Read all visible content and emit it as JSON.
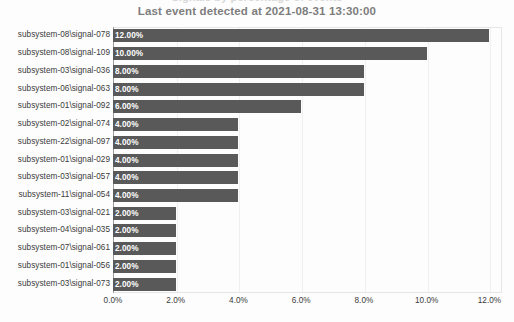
{
  "header": {
    "clipped_title": "Signals by percentage of events",
    "subtitle": "Last event detected at 2021-08-31 13:30:00"
  },
  "colors": {
    "bar": "#595959",
    "bar_label": "#ffffff",
    "subtitle": "#7d7d7d",
    "axis_text": "#3b3b3b",
    "grid": "#f0f0f0",
    "frame": "#e6e6e6",
    "background": "#fdfdfd"
  },
  "chart_data": {
    "type": "bar",
    "orientation": "horizontal",
    "title": "",
    "subtitle": "Last event detected at 2021-08-31 13:30:00",
    "xlabel": "",
    "ylabel": "",
    "xlim": [
      0,
      12.4
    ],
    "xticks": [
      0,
      2,
      4,
      6,
      8,
      10,
      12
    ],
    "xtick_labels": [
      "0.0%",
      "2.0%",
      "4.0%",
      "6.0%",
      "8.0%",
      "10.0%",
      "12.0%"
    ],
    "grid": true,
    "legend": false,
    "value_format": "percent",
    "categories": [
      "subsystem-08\\signal-078",
      "subsystem-08\\signal-109",
      "subsystem-03\\signal-036",
      "subsystem-06\\signal-063",
      "subsystem-01\\signal-092",
      "subsystem-02\\signal-074",
      "subsystem-22\\signal-097",
      "subsystem-01\\signal-029",
      "subsystem-03\\signal-057",
      "subsystem-11\\signal-054",
      "subsystem-03\\signal-021",
      "subsystem-04\\signal-035",
      "subsystem-07\\signal-061",
      "subsystem-01\\signal-056",
      "subsystem-03\\signal-073"
    ],
    "values": [
      12,
      10,
      8,
      8,
      6,
      4,
      4,
      4,
      4,
      4,
      2,
      2,
      2,
      2,
      2
    ],
    "data_labels": [
      "12.00%",
      "10.00%",
      "8.00%",
      "8.00%",
      "6.00%",
      "4.00%",
      "4.00%",
      "4.00%",
      "4.00%",
      "4.00%",
      "2.00%",
      "2.00%",
      "2.00%",
      "2.00%",
      "2.00%"
    ]
  }
}
